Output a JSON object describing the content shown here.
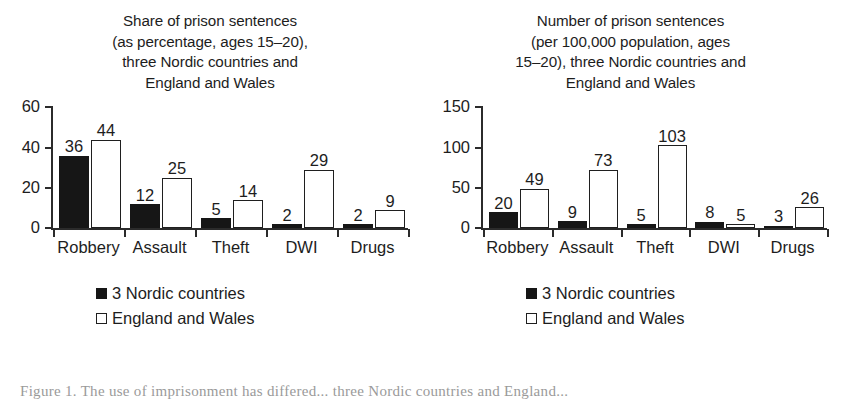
{
  "figure": {
    "caption": "Figure 1.  The use of imprisonment has differed... three Nordic countries and England..."
  },
  "legend": {
    "items": [
      {
        "label": "3 Nordic countries",
        "swatch": "filled-square-icon",
        "color": "#161616"
      },
      {
        "label": "England and Wales",
        "swatch": "hollow-square-icon",
        "color": "#ffffff"
      }
    ]
  },
  "chart_data": [
    {
      "type": "bar",
      "panel": "left",
      "title": "Share of prison sentences (as percentage, ages 15–20), three Nordic countries and England and Wales",
      "title_lines": [
        "Share of prison sentences",
        "(as percentage, ages 15–20),",
        "three Nordic countries and",
        "England and Wales"
      ],
      "categories": [
        "Robbery",
        "Assault",
        "Theft",
        "DWI",
        "Drugs"
      ],
      "series": [
        {
          "name": "3 Nordic countries",
          "values": [
            36,
            12,
            5,
            2,
            2
          ]
        },
        {
          "name": "England and Wales",
          "values": [
            44,
            25,
            14,
            29,
            9
          ]
        }
      ],
      "xlabel": "",
      "ylabel": "",
      "ylim": [
        0,
        60
      ],
      "yticks": [
        0,
        20,
        40,
        60
      ],
      "grid": false,
      "legend_position": "bottom-left"
    },
    {
      "type": "bar",
      "panel": "right",
      "title": "Number of prison sentences (per 100,000 population, ages 15–20), three Nordic countries and England and Wales",
      "title_lines": [
        "Number of prison sentences",
        "(per 100,000 population, ages",
        "15–20), three Nordic countries and",
        "England and Wales"
      ],
      "categories": [
        "Robbery",
        "Assault",
        "Theft",
        "DWI",
        "Drugs"
      ],
      "series": [
        {
          "name": "3 Nordic countries",
          "values": [
            20,
            9,
            5,
            8,
            3
          ]
        },
        {
          "name": "England and Wales",
          "values": [
            49,
            73,
            103,
            5,
            26
          ]
        }
      ],
      "xlabel": "",
      "ylabel": "",
      "ylim": [
        0,
        150
      ],
      "yticks": [
        0,
        50,
        100,
        150
      ],
      "grid": false,
      "legend_position": "bottom-left"
    }
  ]
}
